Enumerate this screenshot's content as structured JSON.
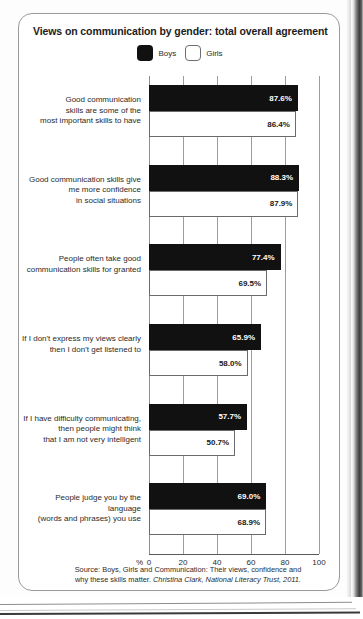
{
  "card": {
    "title": "Views on communication by gender: total overall agreement",
    "source_line1": "Source: Boys, Girls and Communication: Their views, confidence and",
    "source_line2_plain": "why these skills matter. ",
    "source_line2_italic": "Christina Clark, National Literacy Trust, 2011."
  },
  "legend": {
    "items": [
      {
        "label": "Boys",
        "color": "#111111",
        "swatch": "filled-square-icon"
      },
      {
        "label": "Girls",
        "color": "#ffffff",
        "swatch": "outlined-square-icon"
      }
    ]
  },
  "axis": {
    "percent_symbol": "%",
    "ticks": [
      "0",
      "20",
      "40",
      "60",
      "80",
      "100"
    ]
  },
  "chart_data": {
    "type": "bar",
    "orientation": "horizontal",
    "title": "Views on communication by gender: total overall agreement",
    "xlabel": "%",
    "ylabel": "",
    "xlim": [
      0,
      100
    ],
    "grid": true,
    "legend_position": "top-center",
    "categories": [
      "Good communication skills are some of the most important skills to have",
      "Good communication skills give me more confidence in social situations",
      "People often take good communication skills for granted",
      "If I don't express my views clearly then I don't get listened to",
      "If I have difficulty communicating, then people might think that I am not very intelligent",
      "People judge you by the language (words and phrases) you use"
    ],
    "category_lines": [
      [
        "Good communication",
        "skills are some of the",
        "most important skills to have"
      ],
      [
        "Good communication skills give",
        "me more confidence",
        "in social situations"
      ],
      [
        "People often take good",
        "communication skills for granted"
      ],
      [
        "If I don't express my views clearly",
        "then I don't get listened to"
      ],
      [
        "If I have difficulty communicating,",
        "then people might think",
        "that I am not very intelligent"
      ],
      [
        "People judge you by the language",
        "(words and phrases) you use"
      ]
    ],
    "series": [
      {
        "name": "Boys",
        "color": "#111111",
        "values": [
          87.6,
          88.3,
          77.4,
          65.9,
          57.7,
          69.0
        ],
        "labels": [
          "87.6%",
          "88.3%",
          "77.4%",
          "65.9%",
          "57.7%",
          "69.0%"
        ]
      },
      {
        "name": "Girls",
        "color": "#ffffff",
        "values": [
          86.4,
          87.9,
          69.5,
          58.0,
          50.7,
          68.9
        ],
        "labels": [
          "86.4%",
          "87.9%",
          "69.5%",
          "58.0%",
          "50.7%",
          "68.9%"
        ]
      }
    ],
    "source": "Source: Boys, Girls and Communication: Their views, confidence and why these skills matter. Christina Clark, National Literacy Trust, 2011."
  }
}
